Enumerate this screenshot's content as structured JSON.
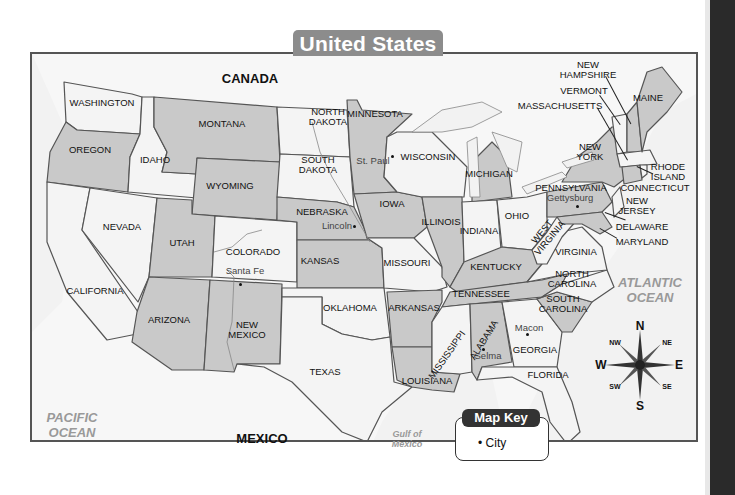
{
  "title": "United States",
  "colors": {
    "shaded_state": "#c9c9c9",
    "light_state": "#f4f4f4",
    "water": "#f0f0f0",
    "border": "#555555",
    "banner": "#8c8c8c",
    "ocean_label": "#999999"
  },
  "countries": {
    "canada": "CANADA",
    "mexico": "MEXICO"
  },
  "water_bodies": {
    "pacific": {
      "line1": "PACIFIC",
      "line2": "OCEAN"
    },
    "atlantic": {
      "line1": "ATLANTIC",
      "line2": "OCEAN"
    },
    "gulf": {
      "line1": "Gulf of",
      "line2": "Mexico"
    }
  },
  "states": {
    "washington": "WASHINGTON",
    "oregon": "OREGON",
    "california": "CALIFORNIA",
    "idaho": "IDAHO",
    "nevada": "NEVADA",
    "montana": "MONTANA",
    "wyoming": "WYOMING",
    "utah": "UTAH",
    "arizona": "ARIZONA",
    "colorado": "COLORADO",
    "new_mexico": {
      "line1": "NEW",
      "line2": "MEXICO"
    },
    "north_dakota": {
      "line1": "NORTH",
      "line2": "DAKOTA"
    },
    "south_dakota": {
      "line1": "SOUTH",
      "line2": "DAKOTA"
    },
    "nebraska": "NEBRASKA",
    "kansas": "KANSAS",
    "oklahoma": "OKLAHOMA",
    "texas": "TEXAS",
    "minnesota": "MINNESOTA",
    "iowa": "IOWA",
    "missouri": "MISSOURI",
    "arkansas": "ARKANSAS",
    "louisiana": "LOUISIANA",
    "wisconsin": "WISCONSIN",
    "illinois": "ILLINOIS",
    "michigan": "MICHIGAN",
    "indiana": "INDIANA",
    "ohio": "OHIO",
    "kentucky": "KENTUCKY",
    "tennessee": "TENNESSEE",
    "mississippi": "MISSISSIPPI",
    "alabama": "ALABAMA",
    "georgia": "GEORGIA",
    "florida": "FLORIDA",
    "south_carolina": {
      "line1": "SOUTH",
      "line2": "CAROLINA"
    },
    "north_carolina": {
      "line1": "NORTH",
      "line2": "CAROLINA"
    },
    "virginia": "VIRGINIA",
    "west_virginia": {
      "line1": "WEST",
      "line2": "VIRGINIA"
    },
    "pennsylvania": "PENNSYLVANIA",
    "new_york": {
      "line1": "NEW",
      "line2": "YORK"
    },
    "new_jersey": {
      "line1": "NEW",
      "line2": "JERSEY"
    },
    "delaware": "DELAWARE",
    "maryland": "MARYLAND",
    "connecticut": "CONNECTICUT",
    "rhode_island": {
      "line1": "RHODE",
      "line2": "ISLAND"
    },
    "massachusetts": "MASSACHUSETTS",
    "vermont": "VERMONT",
    "new_hampshire": {
      "line1": "NEW",
      "line2": "HAMPSHIRE"
    },
    "maine": "MAINE"
  },
  "cities": {
    "santa_fe": "Santa Fe",
    "lincoln": "Lincoln",
    "st_paul": "St. Paul",
    "gettysburg": "Gettysburg",
    "macon": "Macon",
    "selma": "Selma"
  },
  "compass": {
    "n": "N",
    "s": "S",
    "e": "E",
    "w": "W",
    "ne": "NE",
    "nw": "NW",
    "se": "SE",
    "sw": "SW"
  },
  "map_key": {
    "title": "Map Key",
    "items": [
      {
        "symbol": "•",
        "label": "City"
      }
    ]
  }
}
